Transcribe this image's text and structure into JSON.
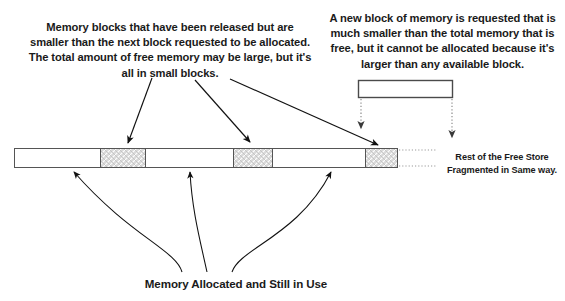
{
  "diagram": {
    "notes": {
      "fragmented_note": "Memory blocks that have been released but are smaller than the next block requested to be allocated. The total amount of free memory may be large, but it's all in small blocks.",
      "request_note": "A new block of memory is requested that is much smaller than the total memory that is free, but it cannot be allocated because it's larger than any available block."
    },
    "captions": {
      "allocated_caption": "Memory Allocated and Still in Use",
      "rest_caption": "Rest of the Free Store Fragmented in Same way."
    },
    "memory_bar": {
      "x": 14,
      "y": 148,
      "width": 384,
      "height": 20,
      "blocks": [
        {
          "label": "free-block-1",
          "kind": "free",
          "x": 14,
          "width": 86
        },
        {
          "label": "used-block-1",
          "kind": "used",
          "x": 100,
          "width": 45
        },
        {
          "label": "free-block-2",
          "kind": "free",
          "x": 145,
          "width": 88
        },
        {
          "label": "used-block-2",
          "kind": "used",
          "x": 233,
          "width": 39
        },
        {
          "label": "free-block-3",
          "kind": "free",
          "x": 272,
          "width": 93
        },
        {
          "label": "used-block-3",
          "kind": "used",
          "x": 365,
          "width": 33
        }
      ]
    },
    "requested_block": {
      "label": "requested-memory-block",
      "x": 358,
      "y": 80,
      "width": 94,
      "height": 17
    },
    "colors": {
      "free_fill": "#ffffff",
      "used_fill": "#d4d4d4",
      "stroke": "#555555",
      "arrow": "#111111",
      "dotted": "#8d8d8d",
      "text": "#1a1a1a",
      "background": "#ffffff"
    },
    "arrows": {
      "pointers_to_free_blocks": 3,
      "pointers_to_used_blocks": 3,
      "dotted_pointers_from_request": 2
    }
  }
}
